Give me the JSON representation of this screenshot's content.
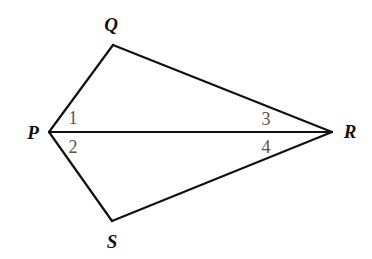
{
  "figure": {
    "background_color": "#ffffff",
    "stroke_color": "#14100f",
    "stroke_width": 2.2,
    "vertex_label_color": "#14100f",
    "angle_label_color": "#585553",
    "vertices": [
      {
        "id": "P",
        "label": "P",
        "x": 49,
        "y": 132,
        "label_x": 33,
        "label_y": 132
      },
      {
        "id": "Q",
        "label": "Q",
        "x": 113,
        "y": 45,
        "label_x": 111,
        "label_y": 24
      },
      {
        "id": "R",
        "label": "R",
        "x": 332,
        "y": 132,
        "label_x": 350,
        "label_y": 131
      },
      {
        "id": "S",
        "label": "S",
        "x": 112,
        "y": 221,
        "label_x": 112,
        "label_y": 241
      }
    ],
    "edges": [
      {
        "id": "PQ",
        "from": "P",
        "to": "Q"
      },
      {
        "id": "QR",
        "from": "Q",
        "to": "R"
      },
      {
        "id": "PR",
        "from": "P",
        "to": "R"
      },
      {
        "id": "PS",
        "from": "P",
        "to": "S"
      },
      {
        "id": "SR",
        "from": "S",
        "to": "R"
      }
    ],
    "angle_labels": [
      {
        "id": "angle-1",
        "label": "1",
        "at_vertex": "P",
        "between": "PQ-PR",
        "x": 73,
        "y": 118
      },
      {
        "id": "angle-2",
        "label": "2",
        "at_vertex": "P",
        "between": "PR-PS",
        "x": 73,
        "y": 147
      },
      {
        "id": "angle-3",
        "label": "3",
        "at_vertex": "R",
        "between": "RQ-RP",
        "x": 266,
        "y": 119
      },
      {
        "id": "angle-4",
        "label": "4",
        "at_vertex": "R",
        "between": "RP-RS",
        "x": 266,
        "y": 147
      }
    ]
  }
}
